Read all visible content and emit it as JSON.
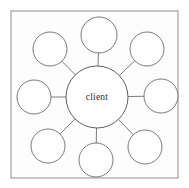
{
  "diagram": {
    "title": "client",
    "type": "hub-and-spoke",
    "frame": {
      "x": 11,
      "y": 11,
      "width": 167,
      "height": 167,
      "stroke": "#8d8d8d",
      "fill": "#fdfdfd"
    },
    "hub": {
      "label": "client",
      "cx": 97,
      "cy": 97,
      "r": 31,
      "stroke": "#5f5f5f",
      "fill": "#ffffff",
      "text_color": "#2e2e2e"
    },
    "edge_color": "#6f6f6f",
    "node_stroke": "#6b6b6b",
    "node_fill": "#ffffff",
    "nodes": [
      {
        "name": "node-top",
        "label": "",
        "cx": 99,
        "cy": 35,
        "r": 18
      },
      {
        "name": "node-top-right",
        "label": "",
        "cx": 147,
        "cy": 49,
        "r": 17
      },
      {
        "name": "node-right",
        "label": "",
        "cx": 161,
        "cy": 96,
        "r": 17
      },
      {
        "name": "node-bottom-right",
        "label": "",
        "cx": 145,
        "cy": 147,
        "r": 17
      },
      {
        "name": "node-bottom",
        "label": "",
        "cx": 96,
        "cy": 160,
        "r": 17
      },
      {
        "name": "node-bottom-left",
        "label": "",
        "cx": 48,
        "cy": 146,
        "r": 17
      },
      {
        "name": "node-left",
        "label": "",
        "cx": 34,
        "cy": 97,
        "r": 17
      },
      {
        "name": "node-top-left",
        "label": "",
        "cx": 50,
        "cy": 49,
        "r": 17
      }
    ]
  }
}
